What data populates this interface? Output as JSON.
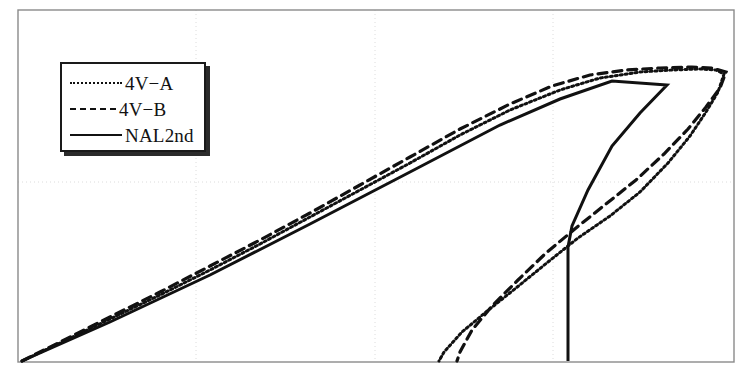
{
  "figure": {
    "width": 748,
    "height": 377,
    "background": "#ffffff",
    "frame": {
      "x0": 18,
      "y0": 10,
      "x1": 734,
      "y1": 362,
      "color": "#8a8a8a",
      "line_width": 1.4
    }
  },
  "legend": {
    "position": "upper-left",
    "box": {
      "x": 60,
      "y": 62,
      "width": 146,
      "height": 90
    },
    "border_color": "#1a1a1a",
    "shadow_color": "#2b2b2b",
    "entries": [
      {
        "label": "4V−A",
        "style": "dotted",
        "sample_name": "legend-sample-dotted"
      },
      {
        "label": "4V−B",
        "style": "dashed",
        "sample_name": "legend-sample-dashed"
      },
      {
        "label": "NAL2nd",
        "style": "solid",
        "sample_name": "legend-sample-solid"
      }
    ]
  },
  "chart_data": {
    "type": "line",
    "title": "",
    "subtitle": "",
    "xlabel": "",
    "ylabel": "",
    "xlim": [
      18,
      734
    ],
    "ylim": [
      362,
      10
    ],
    "grid": true,
    "grid_color": "#dcdcdc",
    "grid_style": "dotted",
    "grid_x": [
      196,
      375,
      553
    ],
    "grid_y": [
      182
    ],
    "axis_ticks_visible": false,
    "tick_labels_x": [],
    "tick_labels_y": [],
    "legend_position": "upper-left",
    "annotations": [],
    "note": "Pixel-space polyline vertices; no numeric axis labels are printed in the figure.",
    "series": [
      {
        "name": "4V−A",
        "style": "dotted",
        "color": "#111111",
        "line_width": 3.0,
        "dash_pattern": "2,3",
        "points": [
          [
            22,
            361
          ],
          [
            60,
            343
          ],
          [
            110,
            319
          ],
          [
            160,
            295
          ],
          [
            210,
            270
          ],
          [
            260,
            244
          ],
          [
            310,
            217
          ],
          [
            360,
            190
          ],
          [
            410,
            163
          ],
          [
            460,
            135
          ],
          [
            510,
            110
          ],
          [
            560,
            90
          ],
          [
            600,
            78
          ],
          [
            640,
            72
          ],
          [
            672,
            70
          ],
          [
            700,
            69
          ],
          [
            716,
            70
          ],
          [
            724,
            74
          ],
          [
            718,
            92
          ],
          [
            706,
            112
          ],
          [
            690,
            136
          ],
          [
            668,
            163
          ],
          [
            640,
            192
          ],
          [
            610,
            216
          ],
          [
            578,
            238
          ],
          [
            548,
            262
          ],
          [
            516,
            288
          ],
          [
            486,
            312
          ],
          [
            462,
            332
          ],
          [
            444,
            352
          ],
          [
            439,
            361
          ]
        ]
      },
      {
        "name": "4V−B",
        "style": "dashed",
        "color": "#111111",
        "line_width": 3.2,
        "dash_pattern": "9,6",
        "points": [
          [
            22,
            361
          ],
          [
            60,
            342
          ],
          [
            110,
            317
          ],
          [
            160,
            292
          ],
          [
            210,
            266
          ],
          [
            260,
            240
          ],
          [
            310,
            213
          ],
          [
            360,
            185
          ],
          [
            410,
            157
          ],
          [
            460,
            129
          ],
          [
            510,
            104
          ],
          [
            552,
            86
          ],
          [
            590,
            75
          ],
          [
            626,
            70
          ],
          [
            660,
            68
          ],
          [
            692,
            67
          ],
          [
            712,
            68
          ],
          [
            726,
            72
          ],
          [
            720,
            88
          ],
          [
            706,
            107
          ],
          [
            688,
            129
          ],
          [
            664,
            154
          ],
          [
            636,
            180
          ],
          [
            606,
            204
          ],
          [
            576,
            228
          ],
          [
            546,
            253
          ],
          [
            518,
            280
          ],
          [
            492,
            306
          ],
          [
            472,
            330
          ],
          [
            460,
            352
          ],
          [
            457,
            361
          ]
        ]
      },
      {
        "name": "NAL2nd",
        "style": "solid",
        "color": "#111111",
        "line_width": 3.0,
        "dash_pattern": "",
        "points": [
          [
            22,
            361
          ],
          [
            110,
            322
          ],
          [
            210,
            275
          ],
          [
            310,
            224
          ],
          [
            410,
            172
          ],
          [
            500,
            125
          ],
          [
            560,
            99
          ],
          [
            612,
            81
          ],
          [
            667,
            85
          ],
          [
            640,
            113
          ],
          [
            612,
            146
          ],
          [
            588,
            190
          ],
          [
            572,
            226
          ],
          [
            568,
            247
          ],
          [
            568,
            361
          ]
        ]
      }
    ]
  }
}
